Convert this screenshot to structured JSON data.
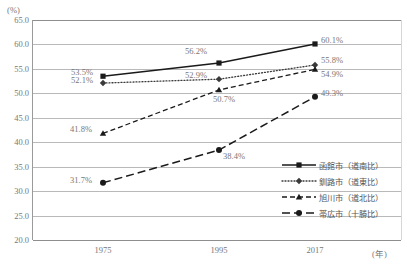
{
  "chart_data": {
    "type": "line",
    "title": "",
    "xlabel": "(年)",
    "ylabel": "(%)",
    "x": [
      "1975",
      "1995",
      "2017"
    ],
    "categories": [
      "1975",
      "1995",
      "2017"
    ],
    "ylim": [
      20.0,
      65.0
    ],
    "ytick_step": 5.0,
    "yticks": [
      "65.0",
      "60.0",
      "55.0",
      "50.0",
      "45.0",
      "40.0",
      "35.0",
      "30.0",
      "25.0",
      "20.0"
    ],
    "grid": true,
    "legend_position": "inside-bottom-right",
    "series": [
      {
        "name": "函館市（道南比）",
        "values": [
          53.5,
          56.2,
          60.1
        ],
        "labels": [
          "53.5%",
          "56.2%",
          "60.1%"
        ],
        "style": "solid",
        "marker": "square",
        "color": "#1a1a1a"
      },
      {
        "name": "釧路市（道東比）",
        "values": [
          52.1,
          52.9,
          55.8
        ],
        "labels": [
          "52.1%",
          "52.9%",
          "55.8%"
        ],
        "style": "dotted",
        "marker": "diamond",
        "color": "#3a3a3a"
      },
      {
        "name": "旭川市（道北比）",
        "values": [
          41.8,
          50.7,
          54.9
        ],
        "labels": [
          "41.8%",
          "50.7%",
          "54.9%"
        ],
        "style": "dashed",
        "marker": "triangle",
        "color": "#1a1a1a"
      },
      {
        "name": "帯広市（十勝比）",
        "values": [
          31.7,
          38.4,
          49.3
        ],
        "labels": [
          "31.7%",
          "38.4%",
          "49.3%"
        ],
        "style": "long-dash",
        "marker": "circle",
        "color": "#1a1a1a"
      }
    ]
  },
  "axes": {
    "y_unit": "(%)",
    "x_unit": "(年)",
    "y_labels": [
      "65.0",
      "60.0",
      "55.0",
      "50.0",
      "45.0",
      "40.0",
      "35.0",
      "30.0",
      "25.0",
      "20.0"
    ],
    "x_labels": [
      "1975",
      "1995",
      "2017"
    ]
  },
  "legend": {
    "items": [
      {
        "label": "函館市（道南比）"
      },
      {
        "label": "釧路市（道東比）"
      },
      {
        "label": "旭川市（道北比）"
      },
      {
        "label": "帯広市（十勝比）"
      }
    ]
  },
  "data_labels": {
    "hakodate": {
      "p1975": "53.5%",
      "p1995": "56.2%",
      "p2017": "60.1%"
    },
    "kushiro": {
      "p1975": "52.1%",
      "p1995": "52.9%",
      "p2017": "55.8%"
    },
    "asahikawa": {
      "p1975": "41.8%",
      "p1995": "50.7%",
      "p2017": "54.9%"
    },
    "obihiro": {
      "p1975": "31.7%",
      "p1995": "38.4%",
      "p2017": "49.3%"
    }
  },
  "colors": {
    "grid": "#b9b9b9",
    "axis": "#8e8e8e",
    "text": "#777777",
    "line": "#1a1a1a"
  }
}
